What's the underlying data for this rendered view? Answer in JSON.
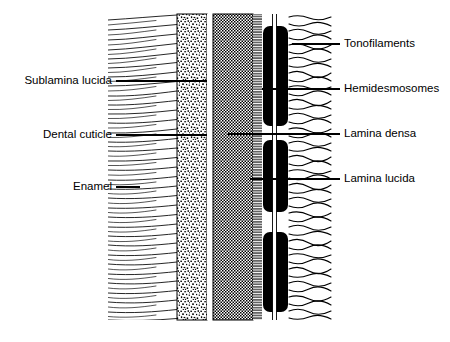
{
  "figure": {
    "background_color": "#ffffff",
    "ink_color": "#000000",
    "width": 450,
    "height": 342
  },
  "labels_left": [
    {
      "id": "sublamina-lucida",
      "text": "Sublamina lucida",
      "text_x": 112,
      "text_y": 81,
      "leader_x1": 116,
      "leader_x2": 207,
      "leader_y": 81
    },
    {
      "id": "dental-cuticle",
      "text": "Dental cuticle",
      "text_x": 112,
      "text_y": 135,
      "leader_x1": 116,
      "leader_x2": 207,
      "leader_y": 135
    },
    {
      "id": "enamel",
      "text": "Enamel",
      "text_x": 112,
      "text_y": 187,
      "leader_x1": 116,
      "leader_x2": 140,
      "leader_y": 187
    }
  ],
  "labels_right": [
    {
      "id": "tonofilaments",
      "text": "Tonofilaments",
      "text_x": 344,
      "text_y": 44,
      "leader_x1": 292,
      "leader_x2": 340,
      "leader_y": 44
    },
    {
      "id": "hemidesmosomes",
      "text": "Hemidesmosomes",
      "text_x": 344,
      "text_y": 89,
      "leader_x1": 262,
      "leader_x2": 340,
      "leader_y": 89
    },
    {
      "id": "lamina-densa",
      "text": "Lamina densa",
      "text_x": 344,
      "text_y": 134,
      "leader_x1": 228,
      "leader_x2": 340,
      "leader_y": 134
    },
    {
      "id": "lamina-lucida",
      "text": "Lamina lucida",
      "text_x": 344,
      "text_y": 179,
      "leader_x1": 250,
      "leader_x2": 340,
      "leader_y": 179
    }
  ],
  "bands": [
    {
      "id": "enamel-rods",
      "name": "Enamel",
      "x": 108,
      "width": 69,
      "fill": "striated-horizontal"
    },
    {
      "id": "dental-cuticle-band",
      "name": "Dental cuticle",
      "x": 177,
      "width": 30,
      "fill": "coarse-stipple"
    },
    {
      "id": "sublamina-gap",
      "name": "Sublamina lucida",
      "x": 207,
      "width": 6,
      "fill": "white"
    },
    {
      "id": "lamina-densa-band",
      "name": "Lamina densa",
      "x": 213,
      "width": 40,
      "fill": "fine-checker"
    },
    {
      "id": "lamina-lucida-band",
      "name": "Lamina lucida",
      "x": 253,
      "width": 10,
      "fill": "fine-bristle"
    },
    {
      "id": "hemidesmosome-band",
      "name": "Hemidesmosomes",
      "x": 263,
      "width": 26,
      "fill": "solid-black-segments"
    },
    {
      "id": "tonofilament-field",
      "name": "Tonofilaments",
      "x": 289,
      "width": 45,
      "fill": "wavy-filaments"
    }
  ],
  "hemidesmosome_segments": [
    {
      "y_top": 26,
      "y_bottom": 126
    },
    {
      "y_top": 140,
      "y_bottom": 212
    },
    {
      "y_top": 232,
      "y_bottom": 312
    }
  ],
  "diagram_extent": {
    "y_top": 14,
    "y_bottom": 320
  }
}
